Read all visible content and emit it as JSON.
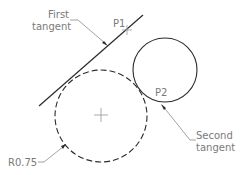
{
  "labels": {
    "first_tangent_line1": "First",
    "first_tangent_line2": "tangent",
    "p1": "P1",
    "p2": "P2",
    "second_tangent_line1": "Second",
    "second_tangent_line2": "tangent",
    "radius": "R0.75"
  },
  "colors": {
    "line": "#2a2a2a",
    "leader": "#8a8a8a",
    "text": "#7a7a7a"
  }
}
